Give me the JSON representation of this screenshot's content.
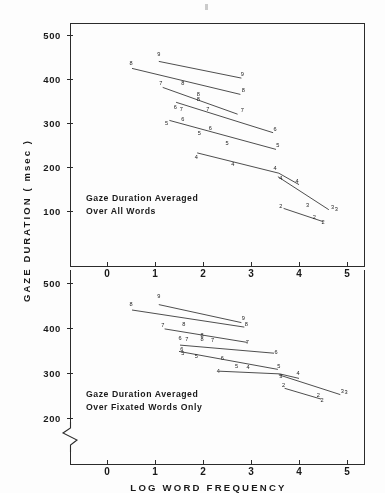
{
  "figure": {
    "y_axis_title": "GAZE DURATION ( msec )",
    "x_axis_title": "LOG  WORD  FREQUENCY",
    "x_axis_subtitle": "( Quartile  Averages )"
  },
  "panels": [
    {
      "id": "top",
      "caption": "Gaze Duration Averaged\nOver All Words",
      "y_ticks": [
        "500",
        "400",
        "300",
        "200",
        "100"
      ],
      "x_ticks": [
        "0",
        "1",
        "2",
        "3",
        "4",
        "5"
      ]
    },
    {
      "id": "bottom",
      "caption": "Gaze Duration Averaged\nOver Fixated Words Only",
      "y_ticks": [
        "500",
        "400",
        "300",
        "200"
      ],
      "x_ticks": [
        "0",
        "1",
        "2",
        "3",
        "4",
        "5"
      ]
    }
  ],
  "chart_data": [
    {
      "type": "line",
      "panel": "top",
      "title": "Gaze Duration Averaged Over All Words",
      "xlabel": "LOG WORD FREQUENCY (Quartile Averages)",
      "ylabel": "GAZE DURATION (msec)",
      "xlim": [
        -0.45,
        5.6
      ],
      "ylim": [
        40,
        530
      ],
      "y_ticks": [
        100,
        200,
        300,
        400,
        500
      ],
      "x_ticks": [
        0,
        1,
        2,
        3,
        4,
        5
      ],
      "grid": false,
      "legend": "none",
      "point_labels": "word length in letters",
      "series": [
        {
          "name": "9",
          "label": "9",
          "x": [
            1.08,
            2.8
          ],
          "y": [
            440,
            402
          ]
        },
        {
          "name": "8",
          "label": "8",
          "x": [
            0.52,
            2.78
          ],
          "y": [
            424,
            365
          ]
        },
        {
          "name": "7",
          "label": "7",
          "x": [
            1.16,
            2.72
          ],
          "y": [
            381,
            320
          ]
        },
        {
          "name": "6",
          "label": "6",
          "x": [
            1.44,
            3.46
          ],
          "y": [
            347,
            278
          ]
        },
        {
          "name": "5",
          "label": "5",
          "x": [
            1.3,
            3.52
          ],
          "y": [
            306,
            240
          ]
        },
        {
          "name": "4",
          "label": "4",
          "x": [
            1.88,
            3.58,
            4.0
          ],
          "y": [
            232,
            186,
            160
          ]
        },
        {
          "name": "3",
          "label": "3",
          "x": [
            3.56,
            4.62
          ],
          "y": [
            178,
            103
          ]
        },
        {
          "name": "2",
          "label": "2",
          "x": [
            3.68,
            4.5
          ],
          "y": [
            106,
            76
          ]
        }
      ],
      "annotated_points": [
        {
          "label": "9",
          "x": 1.08,
          "y": 452
        },
        {
          "label": "9",
          "x": 2.82,
          "y": 408
        },
        {
          "label": "8",
          "x": 0.5,
          "y": 432
        },
        {
          "label": "8",
          "x": 2.84,
          "y": 370
        },
        {
          "label": "8",
          "x": 1.58,
          "y": 386
        },
        {
          "label": "8",
          "x": 1.9,
          "y": 361
        },
        {
          "label": "8",
          "x": 1.9,
          "y": 351
        },
        {
          "label": "7",
          "x": 1.12,
          "y": 386
        },
        {
          "label": "7",
          "x": 1.55,
          "y": 327
        },
        {
          "label": "7",
          "x": 2.1,
          "y": 328
        },
        {
          "label": "7",
          "x": 2.82,
          "y": 325
        },
        {
          "label": "6",
          "x": 1.42,
          "y": 331
        },
        {
          "label": "6",
          "x": 1.58,
          "y": 305
        },
        {
          "label": "6",
          "x": 2.15,
          "y": 284
        },
        {
          "label": "6",
          "x": 3.5,
          "y": 283
        },
        {
          "label": "5",
          "x": 1.24,
          "y": 296
        },
        {
          "label": "5",
          "x": 1.92,
          "y": 272
        },
        {
          "label": "5",
          "x": 2.5,
          "y": 250
        },
        {
          "label": "5",
          "x": 3.56,
          "y": 245
        },
        {
          "label": "4",
          "x": 1.86,
          "y": 219
        },
        {
          "label": "4",
          "x": 2.62,
          "y": 203
        },
        {
          "label": "4",
          "x": 3.5,
          "y": 193
        },
        {
          "label": "4",
          "x": 3.62,
          "y": 170
        },
        {
          "label": "4",
          "x": 3.96,
          "y": 163
        },
        {
          "label": "3",
          "x": 4.18,
          "y": 110
        },
        {
          "label": "3",
          "x": 4.7,
          "y": 104
        },
        {
          "label": "3",
          "x": 4.78,
          "y": 101
        },
        {
          "label": "2",
          "x": 3.62,
          "y": 108
        },
        {
          "label": "2",
          "x": 4.5,
          "y": 71
        },
        {
          "label": "2",
          "x": 4.32,
          "y": 81
        }
      ]
    },
    {
      "type": "line",
      "panel": "bottom",
      "title": "Gaze Duration Averaged Over Fixated Words Only",
      "xlabel": "LOG WORD FREQUENCY (Quartile Averages)",
      "ylabel": "GAZE DURATION (msec)",
      "xlim": [
        -0.45,
        5.6
      ],
      "ylim": [
        175,
        530
      ],
      "y_ticks": [
        200,
        300,
        400,
        500
      ],
      "x_ticks": [
        0,
        1,
        2,
        3,
        4,
        5
      ],
      "grid": false,
      "axis_break_below": 200,
      "legend": "none",
      "point_labels": "word length in letters",
      "series": [
        {
          "name": "9",
          "label": "9",
          "x": [
            1.08,
            2.8
          ],
          "y": [
            452,
            412
          ]
        },
        {
          "name": "8",
          "label": "8",
          "x": [
            0.52,
            2.86
          ],
          "y": [
            440,
            402
          ]
        },
        {
          "name": "7",
          "label": "7",
          "x": [
            1.2,
            2.92
          ],
          "y": [
            398,
            368
          ]
        },
        {
          "name": "6",
          "label": "6",
          "x": [
            1.52,
            3.48
          ],
          "y": [
            362,
            344
          ]
        },
        {
          "name": "5",
          "label": "5",
          "x": [
            1.5,
            3.56
          ],
          "y": [
            348,
            308
          ]
        },
        {
          "name": "4",
          "label": "4",
          "x": [
            2.34,
            3.6,
            4.0
          ],
          "y": [
            304,
            298,
            288
          ]
        },
        {
          "name": "3",
          "label": "3",
          "x": [
            3.58,
            4.86
          ],
          "y": [
            296,
            252
          ]
        },
        {
          "name": "2",
          "label": "2",
          "x": [
            3.7,
            4.46
          ],
          "y": [
            266,
            242
          ]
        }
      ],
      "annotated_points": [
        {
          "label": "9",
          "x": 1.08,
          "y": 466
        },
        {
          "label": "9",
          "x": 2.84,
          "y": 418
        },
        {
          "label": "8",
          "x": 0.5,
          "y": 448
        },
        {
          "label": "8",
          "x": 2.9,
          "y": 405
        },
        {
          "label": "8",
          "x": 1.6,
          "y": 404
        },
        {
          "label": "8",
          "x": 1.98,
          "y": 380
        },
        {
          "label": "8",
          "x": 1.98,
          "y": 372
        },
        {
          "label": "7",
          "x": 1.16,
          "y": 402
        },
        {
          "label": "7",
          "x": 1.66,
          "y": 372
        },
        {
          "label": "7",
          "x": 2.2,
          "y": 370
        },
        {
          "label": "7",
          "x": 2.92,
          "y": 364
        },
        {
          "label": "6",
          "x": 1.52,
          "y": 374
        },
        {
          "label": "6",
          "x": 1.56,
          "y": 350
        },
        {
          "label": "6",
          "x": 2.4,
          "y": 330
        },
        {
          "label": "6",
          "x": 3.52,
          "y": 342
        },
        {
          "label": "5",
          "x": 1.58,
          "y": 340
        },
        {
          "label": "5",
          "x": 1.86,
          "y": 334
        },
        {
          "label": "5",
          "x": 2.7,
          "y": 312
        },
        {
          "label": "5",
          "x": 3.58,
          "y": 312
        },
        {
          "label": "4",
          "x": 2.32,
          "y": 300
        },
        {
          "label": "4",
          "x": 2.94,
          "y": 310
        },
        {
          "label": "4",
          "x": 3.98,
          "y": 296
        },
        {
          "label": "3",
          "x": 3.62,
          "y": 288
        },
        {
          "label": "3",
          "x": 4.9,
          "y": 256
        },
        {
          "label": "3",
          "x": 4.98,
          "y": 254
        },
        {
          "label": "2",
          "x": 3.68,
          "y": 268
        },
        {
          "label": "2",
          "x": 4.48,
          "y": 236
        },
        {
          "label": "2",
          "x": 4.4,
          "y": 246
        }
      ]
    }
  ]
}
